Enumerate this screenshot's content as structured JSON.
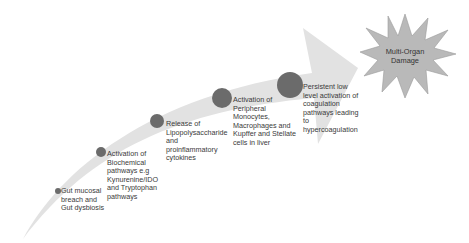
{
  "diagram": {
    "type": "process-arrow",
    "colors": {
      "arrow_fill": "#e2e2e2",
      "circle_fill": "#6b6b6b",
      "burst_fill": "#b9b9b9",
      "burst_stroke": "#9a9a9a",
      "text": "#3a3a3a"
    },
    "steps": [
      {
        "label": "Gut mucosal\nbreach and\nGut dysbiosis"
      },
      {
        "label": "Activation of\nBiochemical\npathways e.g\nKynurenine/IDO\nand Tryptophan\npathways"
      },
      {
        "label": "Release of\nLipopolysaccharide\nand\nproinflammatory\ncytokines"
      },
      {
        "label": "Activation of\nPeripheral\nMonocytes,\nMacrophages and\nKupffer and Stellate\ncells in liver"
      },
      {
        "label": "Persistent low\nlevel activation of\ncoagulation\npathways leading\nto\nhypercoagulation"
      }
    ],
    "outcome": {
      "label": "Multi-Organ\nDamage"
    }
  }
}
